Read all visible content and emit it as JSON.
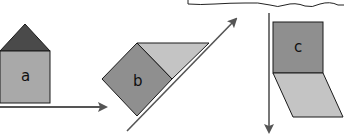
{
  "diagram": {
    "colors": {
      "dark_fill": "#8f8f8f",
      "light_fill": "#c4c4c4",
      "roof_fill": "#4a4a4a",
      "stroke": "#1a1a1a",
      "arrow": "#555555"
    },
    "shapes": [
      {
        "id": "a",
        "label": "a",
        "description": "house shape (square with triangular roof) on horizontal arrow"
      },
      {
        "id": "b",
        "label": "b",
        "description": "rotated square with triangle beside diagonal arrow"
      },
      {
        "id": "c",
        "label": "c",
        "description": "square with parallelogram below, beside vertical downward arrow"
      }
    ]
  }
}
